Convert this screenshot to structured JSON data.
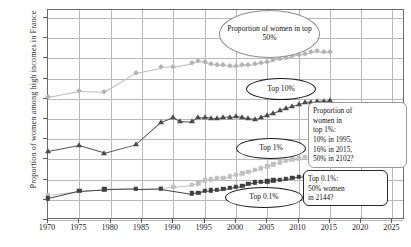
{
  "chart_data": {
    "type": "line",
    "title": "",
    "xlabel": "",
    "ylabel": "Proportion of women among high incomes in France",
    "xlim": [
      1970,
      2027
    ],
    "ylim": [
      0,
      52
    ],
    "grid": true,
    "legend_position": "none",
    "xticks": [
      "1970",
      "1975",
      "1980",
      "1985",
      "1990",
      "1995",
      "2000",
      "2005",
      "2010",
      "2015",
      "2020",
      "2025"
    ],
    "yticks": [
      "0%",
      "5%",
      "10%",
      "15%",
      "20%",
      "25%",
      "30%",
      "35%",
      "40%",
      "45%",
      "50%"
    ],
    "series": [
      {
        "name": "Top 50%",
        "marker": "diamond",
        "color": "#b3b3b3",
        "x": [
          1970,
          1975,
          1979,
          1984,
          1988,
          1990,
          1993,
          1994,
          1995,
          1996,
          1997,
          1998,
          1999,
          2000,
          2001,
          2002,
          2003,
          2004,
          2005,
          2006,
          2007,
          2008,
          2009,
          2010,
          2011,
          2012,
          2013,
          2014,
          2015
        ],
        "values": [
          30.5,
          32.0,
          31.8,
          36.5,
          37.8,
          38.0,
          38.9,
          39.4,
          39.2,
          38.6,
          38.4,
          38.3,
          38.2,
          38.1,
          38.3,
          38.4,
          38.6,
          38.9,
          39.2,
          39.6,
          39.9,
          40.2,
          40.6,
          40.9,
          41.2,
          41.6,
          41.8,
          41.5,
          41.6
        ]
      },
      {
        "name": "Top 10%",
        "marker": "triangle",
        "color": "#4a4a4a",
        "x": [
          1970,
          1975,
          1979,
          1984,
          1988,
          1990,
          1991,
          1993,
          1994,
          1995,
          1996,
          1997,
          1998,
          1999,
          2000,
          2001,
          2002,
          2003,
          2004,
          2005,
          2006,
          2007,
          2008,
          2009,
          2010,
          2011,
          2012,
          2013,
          2014,
          2015
        ],
        "values": [
          17.0,
          18.5,
          16.7,
          18.8,
          24.3,
          25.5,
          24.6,
          24.4,
          25.5,
          25.4,
          25.3,
          25.2,
          25.4,
          25.6,
          25.8,
          25.6,
          25.3,
          25.1,
          25.4,
          26.0,
          26.6,
          27.2,
          27.8,
          28.3,
          28.7,
          29.1,
          29.3,
          29.4,
          29.5,
          29.6
        ]
      },
      {
        "name": "Top 1%",
        "marker": "square-light",
        "color": "#c0c0c0",
        "x": [
          1970,
          1975,
          1979,
          1984,
          1988,
          1990,
          1993,
          1994,
          1995,
          1996,
          1997,
          1998,
          1999,
          2000,
          2001,
          2002,
          2003,
          2004,
          2005,
          2006,
          2007,
          2008,
          2009,
          2010,
          2011,
          2012,
          2013,
          2014,
          2015
        ],
        "values": [
          6.3,
          7.3,
          7.7,
          7.8,
          7.9,
          8.2,
          8.7,
          9.1,
          9.8,
          10.1,
          10.3,
          10.5,
          10.8,
          11.2,
          11.6,
          12.0,
          12.4,
          12.8,
          13.3,
          13.8,
          14.3,
          14.7,
          15.0,
          15.3,
          15.6,
          15.8,
          15.9,
          16.0,
          16.1
        ]
      },
      {
        "name": "Top 0.1%",
        "marker": "square-dark",
        "color": "#3f3f3f",
        "x": [
          1970,
          1975,
          1979,
          1984,
          1988,
          1993,
          1994,
          1995,
          1996,
          1997,
          1998,
          1999,
          2000,
          2001,
          2002,
          2003,
          2004,
          2005,
          2006,
          2007,
          2008,
          2009,
          2010,
          2011,
          2012,
          2013,
          2014,
          2015
        ],
        "values": [
          5.4,
          7.2,
          7.6,
          7.7,
          7.8,
          6.6,
          6.7,
          7.3,
          7.4,
          7.5,
          7.7,
          7.9,
          8.2,
          8.4,
          8.9,
          9.3,
          9.5,
          9.6,
          9.8,
          10.0,
          10.2,
          10.4,
          10.7,
          10.9,
          11.2,
          11.3,
          11.2,
          11.3
        ]
      }
    ],
    "annotations": [
      {
        "id": "callout-top50",
        "kind": "ellipse",
        "text": "Proportion of women in top 50%"
      },
      {
        "id": "callout-top10",
        "kind": "ellipse",
        "text": "Top 10%"
      },
      {
        "id": "callout-top1",
        "kind": "ellipse",
        "text": "Top 1%"
      },
      {
        "id": "callout-top01",
        "kind": "ellipse",
        "text": "Top 0.1%"
      },
      {
        "id": "note-top1",
        "kind": "box",
        "line1": "Proportion of",
        "line2": "women in",
        "line3": "top 1%:",
        "line4": "10% in 1995,",
        "line5": "16% in 2015,",
        "line6": "50% in 2102?"
      },
      {
        "id": "note-top01",
        "kind": "box",
        "line1": "Top 0.1%:",
        "line2": "50% women",
        "line3": "in 2144?"
      }
    ]
  }
}
